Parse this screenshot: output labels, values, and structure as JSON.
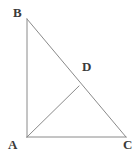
{
  "figure": {
    "kind": "geometry-diagram",
    "background_color": "#ffffff",
    "stroke_color": "#8a8a8a",
    "label_color": "#3a3a3a",
    "stroke_width": 1,
    "canvas": {
      "width": 138,
      "height": 154
    },
    "points": {
      "A": {
        "label": "A",
        "x": 27,
        "y": 137
      },
      "B": {
        "label": "B",
        "x": 27,
        "y": 19
      },
      "C": {
        "label": "C",
        "x": 126,
        "y": 137
      },
      "D": {
        "label": "D",
        "x": 79,
        "y": 86
      }
    },
    "segments": [
      {
        "name": "AB",
        "from": "A",
        "to": "B"
      },
      {
        "name": "AC",
        "from": "A",
        "to": "C"
      },
      {
        "name": "BC",
        "from": "B",
        "to": "C"
      },
      {
        "name": "AD",
        "from": "A",
        "to": "D"
      }
    ],
    "labels": {
      "A": "A",
      "B": "B",
      "C": "C",
      "D": "D"
    }
  }
}
